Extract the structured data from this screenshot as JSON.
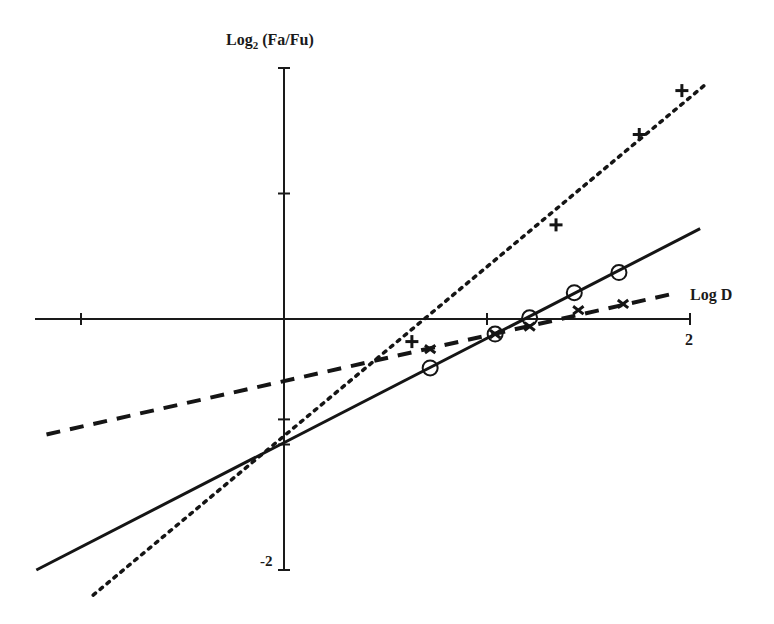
{
  "chart_data": {
    "type": "line",
    "title": "",
    "xlabel": "Log D",
    "ylabel": "Log2 (Fa/Fu)",
    "ylabel_parts": {
      "base": "Log",
      "sub": "2",
      "rest": " (Fa/Fu)"
    },
    "xlim": [
      -1.2,
      2.0
    ],
    "ylim": [
      -2.0,
      2.0
    ],
    "x_tick_values": [
      -1,
      1,
      2
    ],
    "x_tick_labels": [
      {
        "value": 2,
        "text": "2"
      }
    ],
    "y_tick_values": [
      -2,
      -1,
      -0.8,
      1,
      2
    ],
    "y_tick_labels": [
      {
        "value": -2,
        "text": "-2"
      }
    ],
    "grid": false,
    "legend": "none",
    "series": [
      {
        "name": "plus-dotted",
        "marker": "+",
        "line_style": "dotted",
        "points": [
          [
            0.63,
            -0.18
          ],
          [
            1.34,
            0.75
          ],
          [
            1.75,
            1.47
          ],
          [
            1.96,
            1.82
          ]
        ],
        "fit_line": [
          [
            -0.94,
            -2.2
          ],
          [
            2.07,
            1.86
          ]
        ]
      },
      {
        "name": "circle-solid",
        "marker": "o",
        "line_style": "solid",
        "points": [
          [
            0.72,
            -0.39
          ],
          [
            1.04,
            -0.12
          ],
          [
            1.21,
            0.01
          ],
          [
            1.43,
            0.21
          ],
          [
            1.65,
            0.37
          ]
        ],
        "fit_line": [
          [
            -1.22,
            -2.0
          ],
          [
            2.05,
            0.72
          ]
        ]
      },
      {
        "name": "x-dashed",
        "marker": "x",
        "line_style": "dashed",
        "points": [
          [
            0.72,
            -0.24
          ],
          [
            1.04,
            -0.12
          ],
          [
            1.21,
            -0.06
          ],
          [
            1.45,
            0.07
          ],
          [
            1.67,
            0.12
          ]
        ],
        "fit_line": [
          [
            -1.17,
            -0.92
          ],
          [
            1.94,
            0.21
          ]
        ]
      }
    ]
  },
  "layout": {
    "origin_px": [
      284,
      319
    ],
    "x_unit_px": 203,
    "y_unit_px": 125.5,
    "x_axis_px": [
      35,
      690
    ],
    "y_axis_px": [
      69,
      570
    ]
  }
}
